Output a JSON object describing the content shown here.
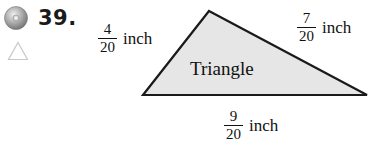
{
  "exercise": {
    "number": "39.",
    "icons": [
      "cd-icon",
      "triangle-outline-icon"
    ]
  },
  "figure": {
    "shape_label": "Triangle",
    "fill_color": "#e6e6e6",
    "stroke_color": "#1a1a1a",
    "sides": [
      {
        "numerator": "4",
        "denominator": "20",
        "unit": "inch",
        "position": "left"
      },
      {
        "numerator": "7",
        "denominator": "20",
        "unit": "inch",
        "position": "right"
      },
      {
        "numerator": "9",
        "denominator": "20",
        "unit": "inch",
        "position": "bottom"
      }
    ]
  }
}
